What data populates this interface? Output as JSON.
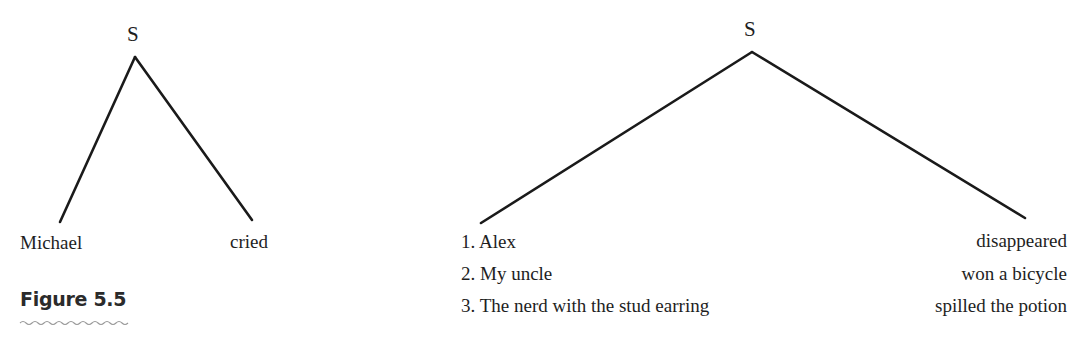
{
  "figure": {
    "caption": "Figure 5.5"
  },
  "left_tree": {
    "root": "S",
    "left_leaf": "Michael",
    "right_leaf": "cried"
  },
  "right_tree": {
    "root": "S",
    "left_leaves": [
      "1. Alex",
      "2. My uncle",
      "3. The nerd with the stud earring"
    ],
    "right_leaves": [
      "disappeared",
      "won a bicycle",
      "spilled the potion"
    ]
  },
  "colors": {
    "line": "#1a1a1a",
    "text": "#1e1e1e",
    "caption_underline": "#9a9a9a"
  }
}
